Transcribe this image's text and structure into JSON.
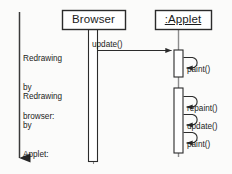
{
  "diagram": {
    "kind": "uml-sequence-diagram",
    "background_color": "#fbfbfa",
    "line_color": "#2b2b2b",
    "text_color": "#1b1b1b",
    "box_fill": "#ffffff"
  },
  "time_axis": {
    "name": "time-arrow",
    "direction": "downward",
    "label": ""
  },
  "lifelines": [
    {
      "id": "browser",
      "label": "Browser",
      "underlined": false,
      "box": {
        "x": 62,
        "y": 10,
        "w": 63,
        "h": 19
      },
      "activations": [
        {
          "x": 88,
          "y": 30,
          "w": 9,
          "h": 132
        }
      ]
    },
    {
      "id": "applet",
      "label": ":Applet",
      "underlined": true,
      "box": {
        "x": 155,
        "y": 10,
        "w": 56,
        "h": 19
      },
      "activations": [
        {
          "x": 174,
          "y": 50,
          "w": 9,
          "h": 27
        },
        {
          "x": 174,
          "y": 88,
          "w": 9,
          "h": 65
        }
      ]
    }
  ],
  "notes": [
    {
      "id": "note-browser-redraw",
      "lines": [
        "Redrawing",
        "by",
        "browser:"
      ],
      "x": 23,
      "y": 36
    },
    {
      "id": "note-applet-redraw",
      "lines": [
        "Redrawing",
        "by",
        "Applet:"
      ],
      "x": 23,
      "y": 74
    }
  ],
  "messages": [
    {
      "id": "msg-update-browser-to-applet",
      "label": "update()",
      "type": "call",
      "from": "browser",
      "to": "applet",
      "label_x": 92,
      "label_y": 41,
      "y": 50
    },
    {
      "id": "msg-paint-self-1",
      "label": "paint()",
      "type": "self-call",
      "from": "applet",
      "to": "applet",
      "label_x": 187,
      "label_y": 66,
      "y": 60
    },
    {
      "id": "msg-repaint-self",
      "label": "repaint()",
      "type": "self-call",
      "from": "applet",
      "to": "applet",
      "label_x": 187,
      "label_y": 105,
      "y": 99
    },
    {
      "id": "msg-update-self",
      "label": "update()",
      "type": "self-call",
      "from": "applet",
      "to": "applet",
      "label_x": 187,
      "label_y": 123,
      "y": 117
    },
    {
      "id": "msg-paint-self-2",
      "label": "paint()",
      "type": "self-call",
      "from": "applet",
      "to": "applet",
      "label_x": 187,
      "label_y": 141,
      "y": 135
    }
  ]
}
